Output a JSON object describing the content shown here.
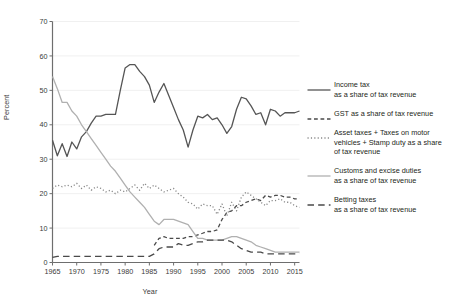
{
  "chart_data": {
    "type": "line",
    "title": "",
    "xlabel": "Year",
    "ylabel": "Percent",
    "xlim": [
      1965,
      2016
    ],
    "ylim": [
      0,
      70
    ],
    "xticks": [
      1965,
      1970,
      1975,
      1980,
      1985,
      1990,
      1995,
      2000,
      2005,
      2010,
      2015
    ],
    "yticks": [
      0,
      10,
      20,
      30,
      40,
      50,
      60,
      70
    ],
    "grid": "horizontal",
    "legend_position": "right",
    "x": [
      1965,
      1966,
      1967,
      1968,
      1969,
      1970,
      1971,
      1972,
      1973,
      1974,
      1975,
      1976,
      1977,
      1978,
      1979,
      1980,
      1981,
      1982,
      1983,
      1984,
      1985,
      1986,
      1987,
      1988,
      1989,
      1990,
      1991,
      1992,
      1993,
      1994,
      1995,
      1996,
      1997,
      1998,
      1999,
      2000,
      2001,
      2002,
      2003,
      2004,
      2005,
      2006,
      2007,
      2008,
      2009,
      2010,
      2011,
      2012,
      2013,
      2014,
      2015,
      2016
    ],
    "series": [
      {
        "name": "Income tax",
        "legend_label": "Income tax\nas a share of tax revenue",
        "style": "solid",
        "color": "#555555",
        "width": 1.3,
        "values": [
          35.5,
          31.0,
          34.5,
          30.8,
          35.0,
          33.0,
          36.5,
          38.0,
          40.5,
          42.5,
          42.5,
          43.0,
          43.0,
          43.0,
          50.0,
          56.5,
          57.5,
          57.5,
          55.5,
          54.0,
          51.5,
          46.5,
          49.5,
          52.0,
          48.5,
          45.0,
          41.5,
          38.5,
          33.5,
          38.5,
          42.5,
          42.0,
          43.0,
          41.5,
          42.0,
          40.0,
          37.5,
          39.5,
          44.5,
          48.0,
          47.5,
          45.5,
          43.0,
          43.5,
          40.0,
          44.5,
          44.0,
          42.5,
          43.5,
          43.5,
          43.5,
          44.0
        ]
      },
      {
        "name": "GST as a share of tax revenue",
        "legend_label": "GST as a share of tax revenue",
        "style": "dashed",
        "color": "#4a4a4a",
        "width": 1.3,
        "values": [
          null,
          null,
          null,
          null,
          null,
          null,
          null,
          null,
          null,
          null,
          null,
          null,
          null,
          null,
          null,
          null,
          null,
          null,
          null,
          null,
          null,
          5.0,
          7.0,
          7.5,
          7.0,
          7.0,
          7.0,
          7.0,
          7.5,
          7.5,
          8.0,
          8.5,
          9.0,
          9.0,
          9.5,
          12.5,
          14.5,
          15.0,
          16.5,
          16.5,
          17.5,
          18.0,
          18.5,
          18.0,
          19.5,
          19.0,
          19.5,
          19.5,
          19.0,
          19.0,
          18.5,
          18.5
        ]
      },
      {
        "name": "Asset taxes + Taxes on motor vehicles + Stamp duty",
        "legend_label": "Asset taxes + Taxes on motor\nvehicles + Stamp duty as a share\nof tax revenue",
        "style": "dotted",
        "color": "#888888",
        "width": 1.3,
        "values": [
          21.5,
          22.5,
          22.0,
          22.5,
          22.0,
          23.0,
          21.5,
          22.5,
          21.0,
          22.0,
          21.5,
          20.5,
          21.0,
          20.0,
          21.0,
          20.5,
          21.5,
          22.5,
          21.0,
          23.0,
          21.5,
          22.5,
          21.5,
          20.5,
          21.0,
          21.5,
          20.0,
          19.0,
          17.5,
          17.0,
          15.5,
          17.0,
          16.5,
          16.5,
          14.0,
          17.0,
          13.5,
          17.5,
          15.0,
          19.0,
          20.5,
          19.5,
          18.5,
          17.5,
          16.5,
          18.0,
          18.0,
          18.5,
          17.5,
          17.5,
          16.5,
          16.0
        ]
      },
      {
        "name": "Customs and excise duties",
        "legend_label": "Customs and excise duties\nas a share of tax revenue",
        "style": "solid",
        "color": "#b0b0b0",
        "width": 1.3,
        "values": [
          54.0,
          50.5,
          46.5,
          46.5,
          44.0,
          42.5,
          40.0,
          38.0,
          36.0,
          34.0,
          32.0,
          30.0,
          28.0,
          26.5,
          24.5,
          22.5,
          20.5,
          19.0,
          17.5,
          16.0,
          14.0,
          12.0,
          11.0,
          12.5,
          12.5,
          12.5,
          12.0,
          11.5,
          11.0,
          9.0,
          7.0,
          7.0,
          6.5,
          6.5,
          6.5,
          6.5,
          7.0,
          7.5,
          7.5,
          7.0,
          6.5,
          6.0,
          5.0,
          4.5,
          4.0,
          3.5,
          3.0,
          3.0,
          3.0,
          3.0,
          3.0,
          3.0
        ]
      },
      {
        "name": "Betting taxes",
        "legend_label": "Betting taxes\nas a share of tax revenue",
        "style": "longdash",
        "color": "#4a4a4a",
        "width": 1.3,
        "values": [
          1.5,
          1.8,
          1.8,
          1.8,
          1.8,
          1.8,
          1.8,
          1.8,
          1.8,
          1.8,
          1.8,
          1.8,
          1.8,
          1.8,
          1.8,
          1.8,
          1.8,
          1.8,
          1.8,
          1.8,
          1.8,
          2.5,
          4.0,
          4.5,
          4.5,
          4.5,
          5.5,
          5.0,
          5.0,
          5.5,
          6.0,
          6.0,
          6.5,
          6.5,
          6.5,
          6.5,
          6.5,
          6.0,
          5.0,
          4.0,
          3.5,
          3.0,
          3.0,
          3.0,
          2.5,
          2.5,
          2.5,
          2.5,
          2.5,
          2.5,
          2.5,
          2.5
        ]
      }
    ]
  }
}
